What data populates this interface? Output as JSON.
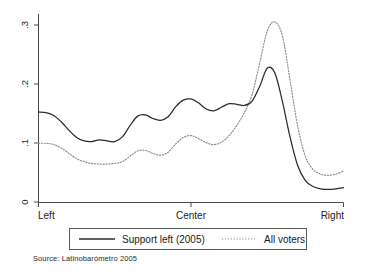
{
  "chart_data": {
    "type": "line",
    "title": "",
    "xlabel": "",
    "ylabel": "",
    "grid": false,
    "legend_position": "bottom-center",
    "xlim": [
      0,
      1
    ],
    "ylim": [
      0,
      0.32
    ],
    "x_tick_labels": [
      "Left",
      "Center",
      "Right"
    ],
    "x_tick_values": [
      0,
      0.5,
      1
    ],
    "y_tick_labels": [
      "0",
      ".1",
      ".2",
      ".3"
    ],
    "y_tick_values": [
      0,
      0.1,
      0.2,
      0.3
    ],
    "x": [
      0.0,
      0.025,
      0.05,
      0.075,
      0.1,
      0.125,
      0.15,
      0.175,
      0.2,
      0.225,
      0.25,
      0.275,
      0.3,
      0.325,
      0.35,
      0.375,
      0.4,
      0.425,
      0.45,
      0.475,
      0.5,
      0.525,
      0.55,
      0.575,
      0.6,
      0.625,
      0.65,
      0.675,
      0.7,
      0.725,
      0.75,
      0.775,
      0.8,
      0.825,
      0.85,
      0.875,
      0.9,
      0.925,
      0.95,
      0.975,
      1.0
    ],
    "series": [
      {
        "name": "Support left (2005)",
        "style": "solid",
        "color": "#2b2b2b",
        "values": [
          0.153,
          0.152,
          0.147,
          0.136,
          0.122,
          0.11,
          0.104,
          0.103,
          0.106,
          0.104,
          0.103,
          0.111,
          0.13,
          0.146,
          0.148,
          0.142,
          0.139,
          0.145,
          0.162,
          0.173,
          0.175,
          0.168,
          0.158,
          0.155,
          0.161,
          0.167,
          0.166,
          0.164,
          0.171,
          0.196,
          0.227,
          0.219,
          0.17,
          0.11,
          0.062,
          0.037,
          0.027,
          0.023,
          0.022,
          0.023,
          0.025
        ]
      },
      {
        "name": "All voters",
        "style": "dotted",
        "color": "#8a8a8a",
        "values": [
          0.1,
          0.1,
          0.098,
          0.092,
          0.083,
          0.074,
          0.069,
          0.066,
          0.065,
          0.065,
          0.066,
          0.069,
          0.078,
          0.087,
          0.088,
          0.083,
          0.08,
          0.085,
          0.099,
          0.11,
          0.113,
          0.108,
          0.101,
          0.098,
          0.102,
          0.113,
          0.13,
          0.152,
          0.182,
          0.235,
          0.29,
          0.305,
          0.281,
          0.206,
          0.128,
          0.078,
          0.056,
          0.048,
          0.046,
          0.048,
          0.053
        ]
      }
    ],
    "solid_tail": {
      "x": [
        0.76,
        0.8,
        0.84,
        0.88,
        0.92,
        0.96,
        1.0
      ],
      "values": [
        0.027,
        0.024,
        0.026,
        0.028,
        0.026,
        0.024,
        0.021
      ]
    },
    "dotted_tail": {
      "x": [
        0.76,
        0.8,
        0.84,
        0.88,
        0.92,
        0.96,
        1.0
      ],
      "values": [
        0.049,
        0.046,
        0.055,
        0.065,
        0.055,
        0.05,
        0.068
      ]
    },
    "annotations": []
  },
  "legend": {
    "entries": [
      {
        "label": "Support left (2005)",
        "style": "solid"
      },
      {
        "label": "All voters",
        "style": "dotted"
      }
    ]
  },
  "source": {
    "text": "Source: Latinobarómetro 2005"
  },
  "axis": {
    "x_left_label": "Left",
    "x_center_label": "Center",
    "x_right_label": "Right",
    "y_label_0": "0",
    "y_label_1": ".1",
    "y_label_2": ".2",
    "y_label_3": ".3"
  }
}
